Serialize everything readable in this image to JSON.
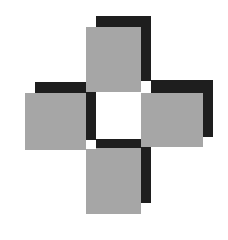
{
  "graphic": {
    "description": "Four gray squares with black drop shadows arranged in a cross around a white center",
    "colors": {
      "face": "#a6a6a6",
      "shadow": "#1e1e1e",
      "background": "#ffffff"
    },
    "tiles": [
      {
        "name": "top",
        "face": {
          "x": 86,
          "y": 27,
          "w": 55,
          "h": 65
        },
        "shadow": {
          "x": 96,
          "y": 16,
          "w": 55,
          "h": 65
        }
      },
      {
        "name": "left",
        "face": {
          "x": 25,
          "y": 93,
          "w": 61,
          "h": 57
        },
        "shadow": {
          "x": 35,
          "y": 82,
          "w": 61,
          "h": 58
        }
      },
      {
        "name": "right",
        "face": {
          "x": 141,
          "y": 93,
          "w": 62,
          "h": 54
        },
        "shadow": {
          "x": 151,
          "y": 80,
          "w": 62,
          "h": 57
        }
      },
      {
        "name": "bottom",
        "face": {
          "x": 86,
          "y": 148,
          "w": 55,
          "h": 66
        },
        "shadow": {
          "x": 96,
          "y": 139,
          "w": 55,
          "h": 64
        }
      }
    ]
  }
}
